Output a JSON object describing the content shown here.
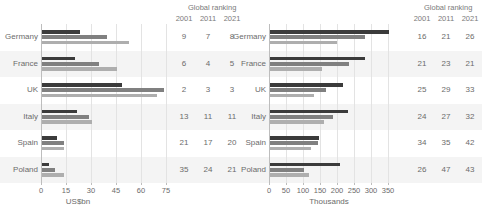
{
  "chart_data": [
    {
      "type": "bar",
      "title": "",
      "xlabel": "US$bn",
      "ylabel": "",
      "orientation": "horizontal",
      "xlim": [
        0,
        75
      ],
      "xticks": [
        0,
        15,
        30,
        45,
        60,
        75
      ],
      "grid": true,
      "legend": "none",
      "categories": [
        "Germany",
        "France",
        "UK",
        "Italy",
        "Spain",
        "Poland"
      ],
      "series": [
        {
          "name": "2001",
          "color": "#3b3b3b",
          "values": [
            23,
            20,
            48,
            21,
            9,
            4
          ]
        },
        {
          "name": "2011",
          "color": "#808080",
          "values": [
            39,
            34,
            73,
            28,
            13,
            8
          ]
        },
        {
          "name": "2021",
          "color": "#aeaeae",
          "values": [
            52,
            45,
            69,
            30,
            13,
            13
          ]
        }
      ],
      "ranking_header": "Global ranking",
      "ranking_years": [
        "2001",
        "2011",
        "2021"
      ],
      "rankings": [
        [
          "9",
          "7",
          "8"
        ],
        [
          "6",
          "4",
          "5"
        ],
        [
          "2",
          "3",
          "3"
        ],
        [
          "13",
          "11",
          "11"
        ],
        [
          "21",
          "17",
          "20"
        ],
        [
          "35",
          "24",
          "21"
        ]
      ]
    },
    {
      "type": "bar",
      "title": "",
      "xlabel": "Thousands",
      "ylabel": "",
      "orientation": "horizontal",
      "xlim": [
        0,
        350
      ],
      "xticks": [
        0,
        50,
        100,
        150,
        200,
        250,
        300,
        350
      ],
      "grid": true,
      "legend": "none",
      "categories": [
        "Germany",
        "France",
        "UK",
        "Italy",
        "Spain",
        "Poland"
      ],
      "series": [
        {
          "name": "2001",
          "color": "#3b3b3b",
          "values": [
            350,
            278,
            215,
            230,
            143,
            205
          ]
        },
        {
          "name": "2011",
          "color": "#808080",
          "values": [
            280,
            232,
            165,
            185,
            142,
            100
          ]
        },
        {
          "name": "2021",
          "color": "#aeaeae",
          "values": [
            197,
            152,
            128,
            160,
            120,
            115
          ]
        }
      ],
      "ranking_header": "Global ranking",
      "ranking_years": [
        "2001",
        "2011",
        "2021"
      ],
      "rankings": [
        [
          "16",
          "21",
          "26"
        ],
        [
          "21",
          "23",
          "21"
        ],
        [
          "25",
          "29",
          "33"
        ],
        [
          "24",
          "27",
          "32"
        ],
        [
          "34",
          "35",
          "42"
        ],
        [
          "26",
          "47",
          "43"
        ]
      ]
    }
  ]
}
